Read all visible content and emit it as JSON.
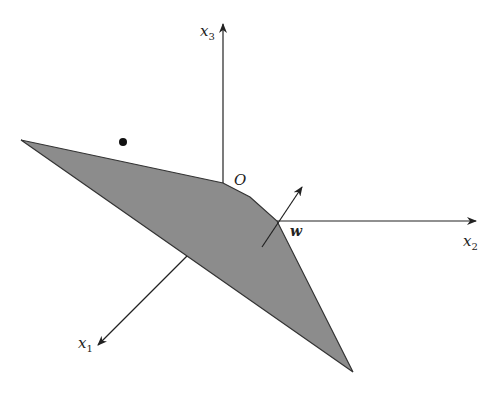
{
  "figure": {
    "colors": {
      "region_fill": "#8c8c8c",
      "line": "#333333",
      "background": "#ffffff"
    }
  },
  "axes": {
    "x1": {
      "label": "x",
      "sub": "1"
    },
    "x2": {
      "label": "x",
      "sub": "2"
    },
    "x3": {
      "label": "x",
      "sub": "3"
    }
  },
  "labels": {
    "origin": "O",
    "normal_vector": "w"
  },
  "point": {
    "name": "external-point"
  }
}
